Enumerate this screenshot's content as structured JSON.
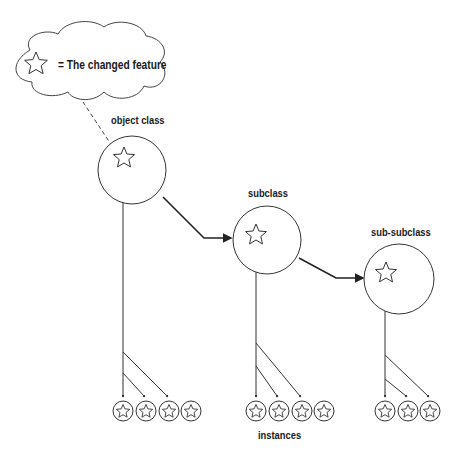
{
  "legend": {
    "icon": "star-icon",
    "text": "= The changed feature"
  },
  "nodes": [
    {
      "id": "object-class",
      "label": "object class",
      "cx": 132,
      "cy": 170,
      "r": 34,
      "star": [
        124,
        158
      ],
      "stem_x": 123,
      "instances": [
        123,
        146,
        169,
        191
      ],
      "branch_y": [
        352,
        373
      ]
    },
    {
      "id": "subclass",
      "label": "subclass",
      "cx": 267,
      "cy": 240,
      "r": 34,
      "star": [
        256,
        235
      ],
      "stem_x": 256,
      "instances": [
        256,
        279,
        302,
        324
      ],
      "branch_y": [
        343,
        366
      ]
    },
    {
      "id": "sub-subclass",
      "label": "sub-subclass",
      "cx": 399,
      "cy": 279,
      "r": 35,
      "star": [
        386,
        273
      ],
      "stem_x": 385,
      "instances": [
        385,
        408,
        430
      ],
      "branch_y": [
        355,
        379
      ]
    }
  ],
  "instances_label": "instances",
  "colors": {
    "stroke": "#333333",
    "background": "#ffffff"
  }
}
